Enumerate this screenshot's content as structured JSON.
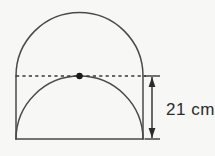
{
  "figure": {
    "background_color": "#f7f7f5",
    "stroke_color": "#4a4a4a",
    "dot_color": "#1a1a1a",
    "dimension": {
      "label": "21 cm",
      "value": 21,
      "unit": "cm",
      "measures": "vertical-height-from-diameter-to-base"
    },
    "geometry": {
      "left_x": 16,
      "right_x": 143,
      "diameter_y": 76,
      "base_y": 139,
      "apex_y": 12,
      "center_x": 79.5,
      "radius": 63.5,
      "dimension_line_x": 152,
      "dot_radius": 3.2
    },
    "parts": {
      "top_arc": "semicircle",
      "left_side": "vertical-line",
      "right_side": "vertical-line",
      "base": "horizontal-line",
      "inner_arcs": "two-concave-quarter-circles-meeting-at-cusp",
      "diameter": "dashed-line",
      "center_point": "dot"
    }
  }
}
